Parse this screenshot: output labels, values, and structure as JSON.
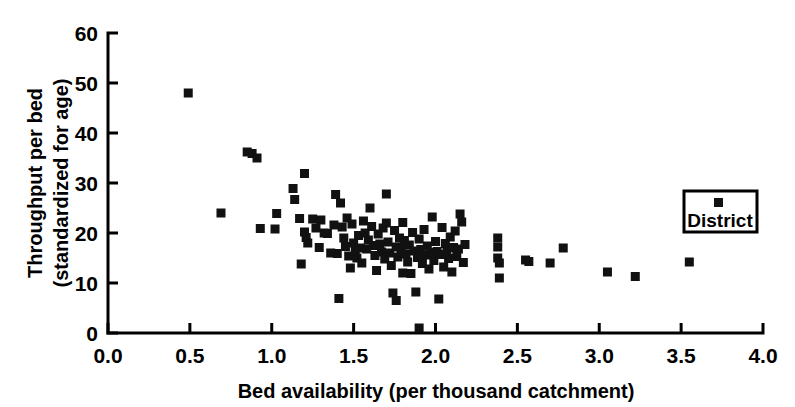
{
  "chart_data": {
    "type": "scatter",
    "title": "",
    "xlabel": "Bed availability (per thousand catchment)",
    "ylabel": "Throughput per bed (standardized for age)",
    "ylabel_line1": "Throughput per bed",
    "ylabel_line2": "(standardized for age)",
    "xlim": [
      0.0,
      4.0
    ],
    "ylim": [
      0,
      60
    ],
    "xticks": [
      0.0,
      0.5,
      1.0,
      1.5,
      2.0,
      2.5,
      3.0,
      3.5,
      4.0
    ],
    "xtick_labels": [
      "0.0",
      "0.5",
      "1.0",
      "1.5",
      "2.0",
      "2.5",
      "3.0",
      "3.5",
      "4.0"
    ],
    "yticks": [
      0,
      10,
      20,
      30,
      40,
      50,
      60
    ],
    "ytick_labels": [
      "0",
      "10",
      "20",
      "30",
      "40",
      "50",
      "60"
    ],
    "grid": false,
    "legend_position": "right",
    "marker_color": "#111111",
    "marker_shape": "square",
    "series": [
      {
        "name": "District",
        "points": [
          [
            0.49,
            48.0
          ],
          [
            0.69,
            24.0
          ],
          [
            0.85,
            36.2
          ],
          [
            0.88,
            35.9
          ],
          [
            0.91,
            35.0
          ],
          [
            0.93,
            20.9
          ],
          [
            1.02,
            20.8
          ],
          [
            1.03,
            23.9
          ],
          [
            1.13,
            28.9
          ],
          [
            1.14,
            26.7
          ],
          [
            1.17,
            22.9
          ],
          [
            1.18,
            13.8
          ],
          [
            1.2,
            31.9
          ],
          [
            1.2,
            20.2
          ],
          [
            1.21,
            19.1
          ],
          [
            1.22,
            18.0
          ],
          [
            1.25,
            22.8
          ],
          [
            1.27,
            21.0
          ],
          [
            1.29,
            17.1
          ],
          [
            1.3,
            22.6
          ],
          [
            1.32,
            20.0
          ],
          [
            1.34,
            19.9
          ],
          [
            1.36,
            16.0
          ],
          [
            1.38,
            21.6
          ],
          [
            1.39,
            27.7
          ],
          [
            1.4,
            15.9
          ],
          [
            1.41,
            6.9
          ],
          [
            1.42,
            26.0
          ],
          [
            1.43,
            21.2
          ],
          [
            1.44,
            19.0
          ],
          [
            1.45,
            17.3
          ],
          [
            1.46,
            23.0
          ],
          [
            1.47,
            15.4
          ],
          [
            1.48,
            13.0
          ],
          [
            1.49,
            21.8
          ],
          [
            1.5,
            18.0
          ],
          [
            1.51,
            16.5
          ],
          [
            1.52,
            15.0
          ],
          [
            1.53,
            19.5
          ],
          [
            1.54,
            17.0
          ],
          [
            1.55,
            14.0
          ],
          [
            1.56,
            22.4
          ],
          [
            1.57,
            20.0
          ],
          [
            1.58,
            16.8
          ],
          [
            1.59,
            18.6
          ],
          [
            1.6,
            25.0
          ],
          [
            1.61,
            21.3
          ],
          [
            1.62,
            17.5
          ],
          [
            1.63,
            15.5
          ],
          [
            1.64,
            12.5
          ],
          [
            1.65,
            19.8
          ],
          [
            1.66,
            17.8
          ],
          [
            1.67,
            16.2
          ],
          [
            1.68,
            21.0
          ],
          [
            1.69,
            14.8
          ],
          [
            1.7,
            27.8
          ],
          [
            1.7,
            22.0
          ],
          [
            1.71,
            18.2
          ],
          [
            1.72,
            16.0
          ],
          [
            1.73,
            13.5
          ],
          [
            1.74,
            8.0
          ],
          [
            1.75,
            20.5
          ],
          [
            1.76,
            17.2
          ],
          [
            1.76,
            6.5
          ],
          [
            1.77,
            15.2
          ],
          [
            1.78,
            19.0
          ],
          [
            1.79,
            16.9
          ],
          [
            1.8,
            22.1
          ],
          [
            1.8,
            12.0
          ],
          [
            1.81,
            18.5
          ],
          [
            1.82,
            15.8
          ],
          [
            1.83,
            14.2
          ],
          [
            1.84,
            17.6
          ],
          [
            1.85,
            11.9
          ],
          [
            1.86,
            20.1
          ],
          [
            1.87,
            16.4
          ],
          [
            1.88,
            8.2
          ],
          [
            1.89,
            15.1
          ],
          [
            1.9,
            1.0
          ],
          [
            1.9,
            18.8
          ],
          [
            1.91,
            16.7
          ],
          [
            1.92,
            13.9
          ],
          [
            1.93,
            20.7
          ],
          [
            1.94,
            15.6
          ],
          [
            1.95,
            17.4
          ],
          [
            1.96,
            12.8
          ],
          [
            1.97,
            16.1
          ],
          [
            1.98,
            23.2
          ],
          [
            1.99,
            14.5
          ],
          [
            2.0,
            18.3
          ],
          [
            2.01,
            16.3
          ],
          [
            2.02,
            6.8
          ],
          [
            2.03,
            15.7
          ],
          [
            2.04,
            21.1
          ],
          [
            2.05,
            13.2
          ],
          [
            2.06,
            17.9
          ],
          [
            2.07,
            16.6
          ],
          [
            2.08,
            14.9
          ],
          [
            2.09,
            19.2
          ],
          [
            2.1,
            12.2
          ],
          [
            2.11,
            17.1
          ],
          [
            2.12,
            20.4
          ],
          [
            2.13,
            15.3
          ],
          [
            2.14,
            16.8
          ],
          [
            2.15,
            23.8
          ],
          [
            2.16,
            22.2
          ],
          [
            2.17,
            14.1
          ],
          [
            2.18,
            17.7
          ],
          [
            2.38,
            19.0
          ],
          [
            2.38,
            17.2
          ],
          [
            2.38,
            15.0
          ],
          [
            2.39,
            14.0
          ],
          [
            2.39,
            11.0
          ],
          [
            2.55,
            14.6
          ],
          [
            2.57,
            14.3
          ],
          [
            2.7,
            14.0
          ],
          [
            2.78,
            17.0
          ],
          [
            3.05,
            12.2
          ],
          [
            3.22,
            11.3
          ],
          [
            3.55,
            14.2
          ]
        ]
      }
    ],
    "legend": {
      "label": "District",
      "marker_color": "#111111"
    }
  },
  "geometry": {
    "plot_left": 108,
    "plot_right": 763,
    "plot_bottom": 333,
    "plot_top": 33
  }
}
